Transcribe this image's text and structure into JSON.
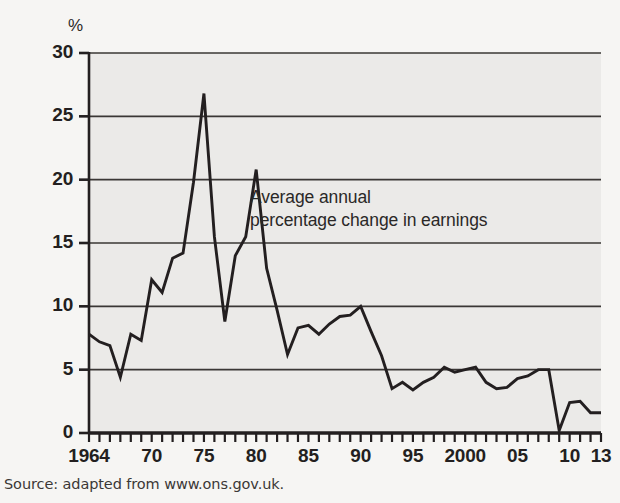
{
  "figure": {
    "background_color": "#f6f5f3",
    "plot_background_color": "#ebeae8",
    "line_color": "#231f20",
    "grid_color": "#3a3735",
    "axis_color": "#231f20"
  },
  "axis_unit_label": "%",
  "annotation": {
    "line1": "Average annual",
    "line2": "percentage change in earnings"
  },
  "source_note": "Source: adapted from www.ons.gov.uk.",
  "chart_data": {
    "type": "line",
    "title": "",
    "subtitle": "",
    "xlabel": "",
    "ylabel": "%",
    "ylim": [
      0,
      30
    ],
    "xlim": [
      1964,
      2013
    ],
    "grid": true,
    "legend_position": "none",
    "annotations": [
      {
        "text": "Average annual percentage change in earnings",
        "x": 1981,
        "y": 18.5
      }
    ],
    "y_ticks": [
      0,
      5,
      10,
      15,
      20,
      25,
      30
    ],
    "y_tick_labels": [
      "0",
      "5",
      "10",
      "15",
      "20",
      "25",
      "30"
    ],
    "x_tick_labels": [
      {
        "value": 1964,
        "label": "1964"
      },
      {
        "value": 1970,
        "label": "70"
      },
      {
        "value": 1975,
        "label": "75"
      },
      {
        "value": 1980,
        "label": "80"
      },
      {
        "value": 1985,
        "label": "85"
      },
      {
        "value": 1990,
        "label": "90"
      },
      {
        "value": 1995,
        "label": "95"
      },
      {
        "value": 2000,
        "label": "2000"
      },
      {
        "value": 2005,
        "label": "05"
      },
      {
        "value": 2010,
        "label": "10"
      },
      {
        "value": 2013,
        "label": "13"
      }
    ],
    "x_minor_tick_interval": 1,
    "series": [
      {
        "name": "Average annual percentage change in earnings",
        "color": "#231f20",
        "x": [
          1964,
          1965,
          1966,
          1967,
          1968,
          1969,
          1970,
          1971,
          1972,
          1973,
          1974,
          1975,
          1976,
          1977,
          1978,
          1979,
          1980,
          1981,
          1982,
          1983,
          1984,
          1985,
          1986,
          1987,
          1988,
          1989,
          1990,
          1991,
          1992,
          1993,
          1994,
          1995,
          1996,
          1997,
          1998,
          1999,
          2000,
          2001,
          2002,
          2003,
          2004,
          2005,
          2006,
          2007,
          2008,
          2009,
          2010,
          2011,
          2012,
          2013
        ],
        "values": [
          7.8,
          7.2,
          6.9,
          4.4,
          7.8,
          7.3,
          12.1,
          11.1,
          13.8,
          14.2,
          19.8,
          26.8,
          15.5,
          8.8,
          14.0,
          15.5,
          20.8,
          13.0,
          9.7,
          6.2,
          8.3,
          8.5,
          7.8,
          8.6,
          9.2,
          9.3,
          10.0,
          8.0,
          6.1,
          3.5,
          4.0,
          3.4,
          4.0,
          4.4,
          5.2,
          4.8,
          5.0,
          5.2,
          4.0,
          3.5,
          3.6,
          4.3,
          4.5,
          5.0,
          5.0,
          0.2,
          2.4,
          2.5,
          1.6,
          1.6
        ]
      }
    ]
  }
}
